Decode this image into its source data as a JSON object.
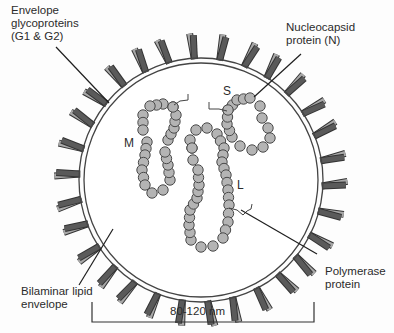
{
  "diagram": {
    "labels": {
      "envelope_glycoproteins": "Envelope\nglycoproteins\n(G1 & G2)",
      "nucleocapsid_protein": "Nucleocapsid\nprotein (N)",
      "bilaminar_lipid_envelope": "Bilaminar lipid\nenvelope",
      "polymerase_protein": "Polymerase\nprotein"
    },
    "segments": {
      "small": "S",
      "medium": "M",
      "large": "L"
    },
    "scale_bar": {
      "label": "80-120 nm"
    },
    "colors": {
      "background": "#fdfdfd",
      "membrane_stroke": "#444444",
      "membrane_fill": "#ffffff",
      "spike_dark": "#5a5a5a",
      "spike_light": "#a8a8a8",
      "bead_fill": "#b4b4b4",
      "bead_stroke": "#4a4a4a",
      "text": "#2b2b2b"
    }
  }
}
